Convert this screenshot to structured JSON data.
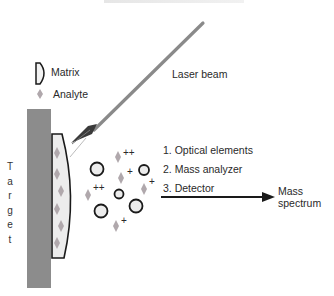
{
  "diagram": {
    "title_fragment": "",
    "legend": {
      "matrix_label": "Matrix",
      "analyte_label": "Analyte"
    },
    "laser_label": "Laser beam",
    "target_label": [
      "T",
      "a",
      "r",
      "g",
      "e",
      "t"
    ],
    "steps": [
      "1. Optical elements",
      "2. Mass analyzer",
      "3. Detector"
    ],
    "output_label_line1": "Mass",
    "output_label_line2": "spectrum",
    "ion_charges": [
      "++",
      "+",
      "++",
      "+",
      "+"
    ],
    "colors": {
      "target": "#8c8c8c",
      "matrix_fill": "#ececec",
      "analyte": "#b0a8ac",
      "laser": "#8a8a8a",
      "outline": "#1a1a1a"
    }
  }
}
